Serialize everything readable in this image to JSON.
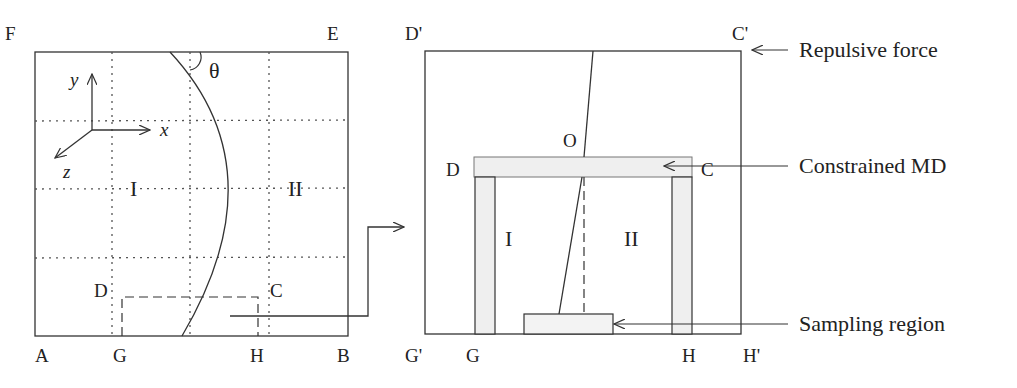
{
  "left_panel": {
    "corners": {
      "top_left": "F",
      "top_right": "E",
      "bottom_left": "A",
      "bottom_right": "B"
    },
    "axes": {
      "x": "x",
      "y": "y",
      "z": "z"
    },
    "angle": "θ",
    "regions": {
      "left": "I",
      "right": "II"
    },
    "subbox": {
      "top_left": "D",
      "top_right": "C",
      "bottom_left": "G",
      "bottom_right": "H"
    }
  },
  "right_panel": {
    "corners": {
      "top_left": "D'",
      "top_right": "C'",
      "bottom_left": "G'",
      "bottom_right": "H'"
    },
    "inner": {
      "top_left": "D",
      "top_right": "C",
      "bottom_left": "G",
      "bottom_right": "H",
      "origin": "O"
    },
    "regions": {
      "left": "I",
      "right": "II"
    }
  },
  "annotations": {
    "repulsive_force": "Repulsive force",
    "constrained_md": "Constrained MD",
    "sampling_region": "Sampling region"
  }
}
